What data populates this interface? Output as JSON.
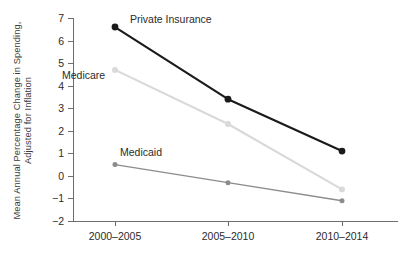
{
  "chart_data": {
    "type": "line",
    "title": "",
    "xlabel": "",
    "ylabel": "Mean Annual Percentage Change in Spending, Adjusted for Inflation",
    "categories": [
      "2000–2005",
      "2005–2010",
      "2010–2014"
    ],
    "ylim": [
      -2,
      7
    ],
    "yticks": [
      7,
      6,
      5,
      4,
      3,
      2,
      1,
      0,
      -1,
      -2
    ],
    "ytick_labels": [
      "7",
      "6",
      "5",
      "4",
      "3",
      "2",
      "1",
      "0",
      "−1",
      "−2"
    ],
    "grid": false,
    "legend": "inline-series-labels",
    "series": [
      {
        "name": "Private Insurance",
        "color": "#1a1a1a",
        "values": [
          6.6,
          3.4,
          1.1
        ]
      },
      {
        "name": "Medicare",
        "color": "#d9d9d9",
        "values": [
          4.7,
          2.3,
          -0.6
        ]
      },
      {
        "name": "Medicaid",
        "color": "#8c8c8c",
        "values": [
          0.5,
          -0.3,
          -1.1
        ]
      }
    ]
  },
  "axes": {
    "axis_color": "#6e6e6e",
    "tick_label_color": "#2b2b2b"
  }
}
